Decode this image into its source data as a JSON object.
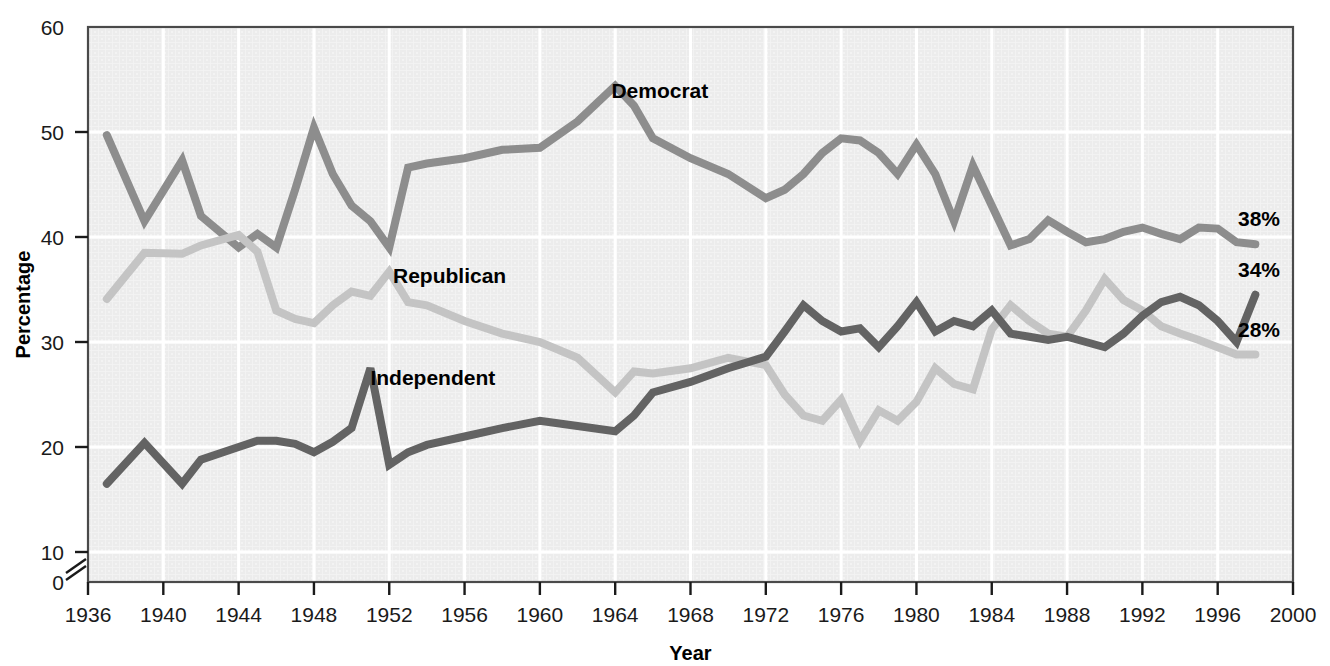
{
  "chart_data": {
    "type": "line",
    "title": "",
    "xlabel": "Year",
    "ylabel": "Percentage",
    "xlim": [
      1936,
      2000
    ],
    "ylim": [
      10,
      60
    ],
    "y_axis_break": true,
    "y_break_labels": [
      "0",
      "10"
    ],
    "grid": true,
    "grid_color": "#ffffff",
    "plot_background": "#ececec",
    "legend_position": "inline-labels",
    "xticks": [
      1936,
      1940,
      1944,
      1948,
      1952,
      1956,
      1960,
      1964,
      1968,
      1972,
      1976,
      1980,
      1984,
      1988,
      1992,
      1996,
      2000
    ],
    "yticks": [
      0,
      10,
      20,
      30,
      40,
      50,
      60
    ],
    "series": [
      {
        "name": "Democrat",
        "color": "#8d8d8d",
        "end_label": "38%",
        "label_x": 1963.8,
        "label_y": 53.2,
        "x": [
          1937,
          1939,
          1941,
          1942,
          1944,
          1945,
          1946,
          1947,
          1948,
          1949,
          1950,
          1951,
          1952,
          1953,
          1954,
          1956,
          1958,
          1960,
          1962,
          1964,
          1965,
          1966,
          1968,
          1970,
          1972,
          1973,
          1974,
          1975,
          1976,
          1977,
          1978,
          1979,
          1980,
          1981,
          1982,
          1983,
          1984,
          1985,
          1986,
          1987,
          1988,
          1989,
          1990,
          1991,
          1992,
          1993,
          1994,
          1995,
          1996,
          1997,
          1998
        ],
        "y": [
          49.7,
          41.5,
          47.3,
          42.0,
          39.0,
          40.3,
          39.0,
          44.5,
          50.4,
          46.0,
          43.0,
          41.5,
          39.0,
          46.6,
          47.0,
          47.5,
          48.3,
          48.5,
          51.0,
          54.4,
          52.5,
          49.4,
          47.5,
          46.0,
          43.7,
          44.5,
          46.0,
          48.0,
          49.4,
          49.2,
          48.0,
          46.0,
          48.8,
          46.0,
          41.5,
          46.8,
          43.0,
          39.2,
          39.8,
          41.6,
          40.5,
          39.5,
          39.8,
          40.5,
          40.9,
          40.3,
          39.8,
          40.9,
          40.8,
          39.5,
          39.3
        ]
      },
      {
        "name": "Republican",
        "color": "#c4c4c4",
        "end_label": "28%",
        "label_x": 1952.2,
        "label_y": 35.6,
        "x": [
          1937,
          1939,
          1941,
          1942,
          1944,
          1945,
          1946,
          1947,
          1948,
          1949,
          1950,
          1951,
          1952,
          1953,
          1954,
          1956,
          1958,
          1960,
          1962,
          1964,
          1965,
          1966,
          1968,
          1970,
          1972,
          1973,
          1974,
          1975,
          1976,
          1977,
          1978,
          1979,
          1980,
          1981,
          1982,
          1983,
          1984,
          1985,
          1986,
          1987,
          1988,
          1989,
          1990,
          1991,
          1992,
          1993,
          1994,
          1995,
          1996,
          1997,
          1998
        ],
        "y": [
          34.1,
          38.5,
          38.4,
          39.2,
          40.2,
          38.6,
          33.0,
          32.2,
          31.8,
          33.5,
          34.8,
          34.4,
          36.7,
          33.8,
          33.5,
          32.0,
          30.8,
          30.0,
          28.5,
          25.2,
          27.2,
          27.0,
          27.5,
          28.5,
          27.8,
          25.0,
          23.0,
          22.5,
          24.5,
          20.6,
          23.5,
          22.5,
          24.3,
          27.5,
          26.0,
          25.5,
          31.2,
          33.5,
          32.0,
          30.8,
          30.5,
          33.0,
          36.0,
          34.0,
          33.0,
          31.5,
          30.8,
          30.2,
          29.5,
          28.8,
          28.8
        ]
      },
      {
        "name": "Independent",
        "color": "#636363",
        "end_label": "34%",
        "label_x": 1951.0,
        "label_y": 25.9,
        "x": [
          1937,
          1939,
          1941,
          1942,
          1944,
          1945,
          1946,
          1947,
          1948,
          1949,
          1950,
          1951,
          1952,
          1953,
          1954,
          1956,
          1958,
          1960,
          1962,
          1964,
          1965,
          1966,
          1968,
          1970,
          1972,
          1973,
          1974,
          1975,
          1976,
          1977,
          1978,
          1979,
          1980,
          1981,
          1982,
          1983,
          1984,
          1985,
          1986,
          1987,
          1988,
          1989,
          1990,
          1991,
          1992,
          1993,
          1994,
          1995,
          1996,
          1997,
          1998
        ],
        "y": [
          16.5,
          20.4,
          16.5,
          18.8,
          20.0,
          20.6,
          20.6,
          20.3,
          19.5,
          20.5,
          21.8,
          27.5,
          18.3,
          19.5,
          20.2,
          21.0,
          21.8,
          22.5,
          22.0,
          21.5,
          23.0,
          25.2,
          26.2,
          27.5,
          28.6,
          31.0,
          33.5,
          32.0,
          31.0,
          31.3,
          29.5,
          31.5,
          33.8,
          31.0,
          32.0,
          31.5,
          33.0,
          30.8,
          30.5,
          30.2,
          30.5,
          30.0,
          29.5,
          30.8,
          32.5,
          33.8,
          34.3,
          33.5,
          32.0,
          30.0,
          34.5
        ]
      }
    ]
  }
}
